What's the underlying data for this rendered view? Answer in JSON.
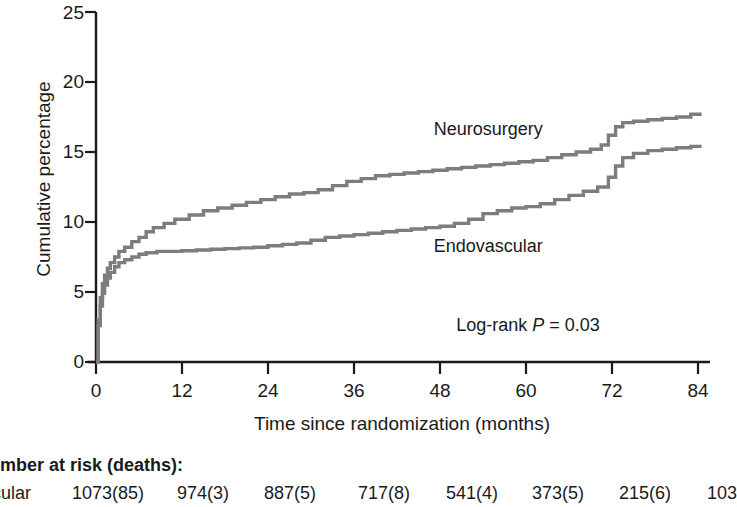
{
  "chart_data": {
    "type": "line",
    "title": "",
    "xlabel": "Time since randomization (months)",
    "ylabel": "Cumulative percentage",
    "xlim": [
      0,
      84
    ],
    "ylim": [
      0,
      25
    ],
    "xticks": [
      0,
      12,
      24,
      36,
      48,
      60,
      72,
      84
    ],
    "xtick_labels": [
      "0",
      "12",
      "24",
      "36",
      "48",
      "60",
      "72",
      "84"
    ],
    "yticks": [
      0,
      5,
      10,
      15,
      20,
      25
    ],
    "ytick_labels": [
      "0",
      "5",
      "10",
      "15",
      "20",
      "25"
    ],
    "grid": false,
    "legend_position": "inline-annotations",
    "line_color": "#7d7d7d",
    "axis_color": "#1a1a1a",
    "annotations": [
      {
        "text": "Log-rank P = 0.03",
        "x": 55,
        "y": 2.6
      }
    ],
    "series": [
      {
        "name": "Neurosurgery",
        "label_x": 55.5,
        "label_y": 16.6,
        "x": [
          0,
          0.3,
          0.6,
          0.9,
          1.2,
          1.6,
          2.0,
          2.6,
          3.2,
          4.0,
          5.0,
          6.0,
          7.0,
          8.0,
          9.5,
          11.0,
          13.0,
          15.0,
          17.0,
          19.0,
          21.0,
          23.0,
          25.0,
          27.0,
          29.0,
          31.0,
          33.0,
          35.0,
          37.0,
          39.0,
          41.0,
          43.0,
          45.0,
          47.0,
          49.0,
          51.0,
          53.0,
          55.0,
          57.0,
          59.0,
          61.0,
          63.0,
          65.0,
          67.0,
          69.0,
          70.5,
          71.5,
          72.5,
          73.5,
          75.0,
          77.0,
          79.0,
          81.0,
          83.0,
          84.5
        ],
        "y": [
          0,
          3.0,
          4.6,
          5.6,
          6.2,
          6.7,
          7.1,
          7.5,
          7.9,
          8.2,
          8.6,
          8.9,
          9.3,
          9.6,
          9.9,
          10.2,
          10.5,
          10.8,
          11.0,
          11.2,
          11.4,
          11.6,
          11.8,
          12.0,
          12.1,
          12.3,
          12.6,
          12.9,
          13.1,
          13.3,
          13.4,
          13.5,
          13.6,
          13.7,
          13.8,
          13.9,
          14.0,
          14.1,
          14.2,
          14.3,
          14.4,
          14.6,
          14.8,
          15.0,
          15.2,
          15.5,
          16.2,
          16.8,
          17.1,
          17.2,
          17.3,
          17.4,
          17.5,
          17.7,
          17.7
        ]
      },
      {
        "name": "Endovascular",
        "label_x": 55.5,
        "label_y": 8.2,
        "x": [
          0,
          0.3,
          0.6,
          0.9,
          1.2,
          1.6,
          2.0,
          2.6,
          3.2,
          4.0,
          5.0,
          6.0,
          7.0,
          8.5,
          10.0,
          12.0,
          14.0,
          16.0,
          18.0,
          20.0,
          22.0,
          24.0,
          26.0,
          28.0,
          30.0,
          32.0,
          34.0,
          36.0,
          38.0,
          40.0,
          42.0,
          44.0,
          46.0,
          48.0,
          50.0,
          52.0,
          54.0,
          56.0,
          58.0,
          60.0,
          62.0,
          64.0,
          66.0,
          68.0,
          70.0,
          71.5,
          72.5,
          73.5,
          75.0,
          77.0,
          79.0,
          81.0,
          83.0,
          84.5
        ],
        "y": [
          0,
          2.6,
          4.0,
          4.9,
          5.5,
          6.0,
          6.4,
          6.8,
          7.1,
          7.3,
          7.5,
          7.7,
          7.8,
          7.9,
          7.9,
          7.95,
          8.0,
          8.05,
          8.1,
          8.15,
          8.2,
          8.3,
          8.4,
          8.5,
          8.7,
          8.9,
          9.0,
          9.1,
          9.2,
          9.3,
          9.4,
          9.5,
          9.6,
          9.7,
          9.9,
          10.2,
          10.6,
          10.8,
          11.0,
          11.1,
          11.3,
          11.6,
          11.9,
          12.2,
          12.5,
          13.2,
          14.0,
          14.6,
          14.9,
          15.1,
          15.2,
          15.3,
          15.4,
          15.4
        ]
      }
    ]
  },
  "risk_table": {
    "title": "Number at risk (deaths):",
    "rows": [
      {
        "name": "Endovascular",
        "values": [
          "1073(85)",
          "974(3)",
          "887(5)",
          "717(8)",
          "541(4)",
          "373(5)",
          "215(6)",
          "103"
        ]
      }
    ]
  }
}
